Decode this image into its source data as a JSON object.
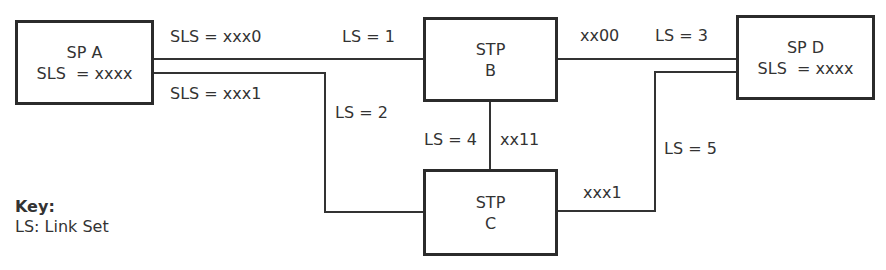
{
  "nodes": {
    "sp_a": {
      "line1": "SP A",
      "line2": "SLS  = xxxx"
    },
    "stp_b": {
      "line1": "STP",
      "line2": "B"
    },
    "sp_d": {
      "line1": "SP D",
      "line2": "SLS  = xxxx"
    },
    "stp_c": {
      "line1": "STP",
      "line2": "C"
    }
  },
  "links": {
    "sls_xxx0": "SLS = xxx0",
    "sls_xxx1": "SLS = xxx1",
    "ls1": "LS = 1",
    "ls2": "LS = 2",
    "ls3": "LS = 3",
    "ls4": "LS = 4",
    "ls5": "LS = 5",
    "xx00": "xx00",
    "xx11": "xx11",
    "xxx1_c": "xxx1"
  },
  "key": {
    "title": "Key:",
    "entry": "LS: Link Set"
  }
}
